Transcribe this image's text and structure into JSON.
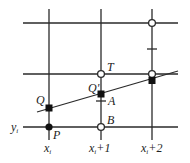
{
  "diagram": {
    "colors": {
      "line": "#2a2a2a",
      "background": "#ffffff"
    },
    "grid": {
      "vertical": [
        {
          "id": "x_i",
          "x": 49,
          "label": "x",
          "sub": "i",
          "suffix": ""
        },
        {
          "id": "x_i_plus_1",
          "x": 101,
          "label": "x",
          "sub": "i",
          "suffix": "+1"
        },
        {
          "id": "x_i_plus_2",
          "x": 152,
          "label": "x",
          "sub": "i",
          "suffix": "+2"
        }
      ],
      "horizontal": [
        {
          "id": "row_top",
          "y": 23
        },
        {
          "id": "row_mid",
          "y": 74
        },
        {
          "id": "y_i",
          "y": 127,
          "label": "y",
          "sub": "i"
        }
      ]
    },
    "line_segment": {
      "x1": 37,
      "y1": 112,
      "x2": 178,
      "y2": 71
    },
    "points": [
      {
        "name": "P",
        "x": 49,
        "y": 127,
        "style": "filled-dot"
      },
      {
        "name": "Q",
        "x": 49,
        "y": 108,
        "style": "filled-square"
      },
      {
        "name": "Q'",
        "x": 101,
        "y": 94,
        "style": "filled-square"
      },
      {
        "name": "T",
        "x": 101,
        "y": 74,
        "style": "open-circle"
      },
      {
        "name": "B",
        "x": 101,
        "y": 127,
        "style": "open-circle"
      },
      {
        "name": "",
        "x": 152,
        "y": 23,
        "style": "open-circle"
      },
      {
        "name": "",
        "x": 152,
        "y": 74,
        "style": "open-circle"
      },
      {
        "name": "",
        "x": 152,
        "y": 80,
        "style": "filled-square"
      }
    ],
    "ticks": [
      {
        "name": "A",
        "x": 101,
        "y": 101
      },
      {
        "name": "",
        "x": 152,
        "y": 49
      }
    ],
    "labels": {
      "P": "P",
      "Q": "Q",
      "Q_prime": "Q'",
      "T": "T",
      "A": "A",
      "B": "B",
      "y_axis": "y",
      "y_sub": "i",
      "x1": "x",
      "x1_sub": "i",
      "x2": "x",
      "x2_sub": "i",
      "x2_suffix": "+1",
      "x3": "x",
      "x3_sub": "i",
      "x3_suffix": "+2"
    }
  }
}
